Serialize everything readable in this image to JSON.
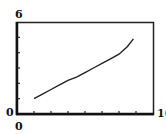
{
  "chart_data": {
    "type": "line",
    "title": "",
    "xlabel": "",
    "ylabel": "",
    "xlim": [
      0,
      16
    ],
    "ylim": [
      0,
      6
    ],
    "x_ticks": [
      2,
      4,
      6,
      8,
      10,
      12,
      14
    ],
    "y_ticks": [
      1,
      2,
      3,
      4,
      5
    ],
    "grid": false,
    "series": [
      {
        "name": "data",
        "x": [
          2.0,
          3.0,
          4.0,
          5.0,
          6.0,
          7.0,
          8.0,
          9.0,
          10.0,
          11.0,
          12.0,
          13.0,
          13.7
        ],
        "y": [
          1.0,
          1.3,
          1.6,
          1.9,
          2.2,
          2.4,
          2.7,
          3.0,
          3.3,
          3.6,
          3.9,
          4.4,
          4.9
        ]
      }
    ]
  },
  "labels": {
    "y_max": "6",
    "y_min": "0",
    "x_min": "0",
    "x_max": "16"
  }
}
